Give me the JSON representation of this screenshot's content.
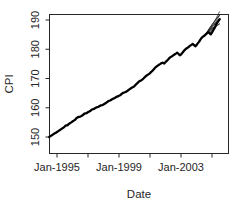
{
  "chart_data": {
    "type": "line",
    "title": "",
    "subtitle": "",
    "xlabel": "Date",
    "ylabel": "CPI",
    "grid": false,
    "legend": null,
    "legend_position": "none",
    "xlim": [
      "Jan-1994",
      "Jan-2006"
    ],
    "ylim": [
      148,
      193
    ],
    "yticks": [
      150,
      160,
      170,
      180,
      190
    ],
    "ytick_labels": [
      "150",
      "160",
      "170",
      "180",
      "190"
    ],
    "xticks": [
      "Jan-1995",
      "Jan-1997",
      "Jan-1999",
      "Jan-2001",
      "Jan-2003",
      "Jan-2005"
    ],
    "xtick_labels": [
      "Jan-1995",
      "",
      "Jan-1999",
      "",
      "Jan-2003",
      ""
    ],
    "xtick_labels_shown": [
      "Jan-1995",
      "Jan-1999",
      "Jan-2003"
    ],
    "line_color": "#000000",
    "series": [
      {
        "name": "CPI",
        "x": [
          "1994.50",
          "1994.58",
          "1994.67",
          "1994.75",
          "1994.83",
          "1994.92",
          "1995.00",
          "1995.08",
          "1995.17",
          "1995.25",
          "1995.33",
          "1995.42",
          "1995.50",
          "1995.58",
          "1995.67",
          "1995.75",
          "1995.83",
          "1995.92",
          "1996.00",
          "1996.08",
          "1996.17",
          "1996.25",
          "1996.33",
          "1996.42",
          "1996.50",
          "1996.58",
          "1996.67",
          "1996.75",
          "1996.83",
          "1996.92",
          "1997.00",
          "1997.08",
          "1997.17",
          "1997.25",
          "1997.33",
          "1997.42",
          "1997.50",
          "1997.58",
          "1997.67",
          "1997.75",
          "1997.83",
          "1997.92",
          "1998.00",
          "1998.08",
          "1998.17",
          "1998.25",
          "1998.33",
          "1998.42",
          "1998.50",
          "1998.58",
          "1998.67",
          "1998.75",
          "1998.83",
          "1998.92",
          "1999.00",
          "1999.08",
          "1999.17",
          "1999.25",
          "1999.33",
          "1999.42",
          "1999.50",
          "1999.58",
          "1999.67",
          "1999.75",
          "1999.83",
          "1999.92",
          "2000.00",
          "2000.08",
          "2000.17",
          "2000.25",
          "2000.33",
          "2000.42",
          "2000.50",
          "2000.58",
          "2000.67",
          "2000.75",
          "2000.83",
          "2000.92",
          "2001.00",
          "2001.08",
          "2001.17",
          "2001.25",
          "2001.33",
          "2001.42",
          "2001.50",
          "2001.58",
          "2001.67",
          "2001.75",
          "2001.83",
          "2001.92",
          "2002.00",
          "2002.08",
          "2002.17",
          "2002.25",
          "2002.33",
          "2002.42",
          "2002.50",
          "2002.58",
          "2002.67",
          "2002.75",
          "2002.83",
          "2002.92",
          "2003.00",
          "2003.08",
          "2003.17",
          "2003.25",
          "2003.33",
          "2003.42",
          "2003.50",
          "2003.58",
          "2003.67",
          "2003.75",
          "2003.83",
          "2003.92",
          "2004.00",
          "2004.08",
          "2004.17",
          "2004.25",
          "2004.33",
          "2004.42",
          "2004.50",
          "2004.58",
          "2004.67",
          "2004.75",
          "2004.83",
          "2004.92",
          "2005.00",
          "2005.08",
          "2005.17",
          "2005.25",
          "2005.33",
          "2005.42",
          "2005.50"
        ],
        "values": [
          150.0,
          150.3,
          150.6,
          150.9,
          151.2,
          151.4,
          151.7,
          152.0,
          152.3,
          152.6,
          152.9,
          153.2,
          153.6,
          154.0,
          154.0,
          154.4,
          154.7,
          155.0,
          155.3,
          155.6,
          155.9,
          156.4,
          156.7,
          156.9,
          157.0,
          157.2,
          157.5,
          157.9,
          158.1,
          158.2,
          158.5,
          158.7,
          159.0,
          159.4,
          159.5,
          159.7,
          160.0,
          160.2,
          160.3,
          160.6,
          160.8,
          160.9,
          161.1,
          161.4,
          161.7,
          162.0,
          162.3,
          162.5,
          162.7,
          163.0,
          163.2,
          163.4,
          163.7,
          163.9,
          164.1,
          164.3,
          164.7,
          165.1,
          165.2,
          165.4,
          165.6,
          165.9,
          166.3,
          166.6,
          166.9,
          167.1,
          167.4,
          167.9,
          168.3,
          168.8,
          169.1,
          169.3,
          169.6,
          170.0,
          170.5,
          170.9,
          171.2,
          171.5,
          171.8,
          172.3,
          172.7,
          173.2,
          173.7,
          174.1,
          174.4,
          174.7,
          175.0,
          175.3,
          175.4,
          175.1,
          175.6,
          176.0,
          176.5,
          177.0,
          177.3,
          177.6,
          177.9,
          178.2,
          178.5,
          178.8,
          178.5,
          177.9,
          178.2,
          178.7,
          179.3,
          179.8,
          180.2,
          180.5,
          180.8,
          181.2,
          181.5,
          181.8,
          181.5,
          181.0,
          181.4,
          182.0,
          182.6,
          183.3,
          183.9,
          184.3,
          184.6,
          185.0,
          185.4,
          185.8,
          185.6,
          185.1,
          185.7,
          186.5,
          187.3,
          188.2,
          189.0,
          189.7,
          190.3
        ]
      }
    ],
    "forecast_fan": {
      "present": true,
      "description": "multiple divergent forecast paths at right end of series",
      "start_x": "2004.50",
      "paths": 9,
      "end_values": [
        188.6,
        189.2,
        189.8,
        190.3,
        190.8,
        191.3,
        191.8,
        192.2,
        192.6
      ]
    }
  },
  "axis": {
    "ylabel": "CPI",
    "xlabel": "Date",
    "ytick_labels": [
      "190",
      "180",
      "170",
      "160",
      "150"
    ],
    "xtick_labels": [
      "Jan-1995",
      "Jan-1999",
      "Jan-2003"
    ]
  }
}
